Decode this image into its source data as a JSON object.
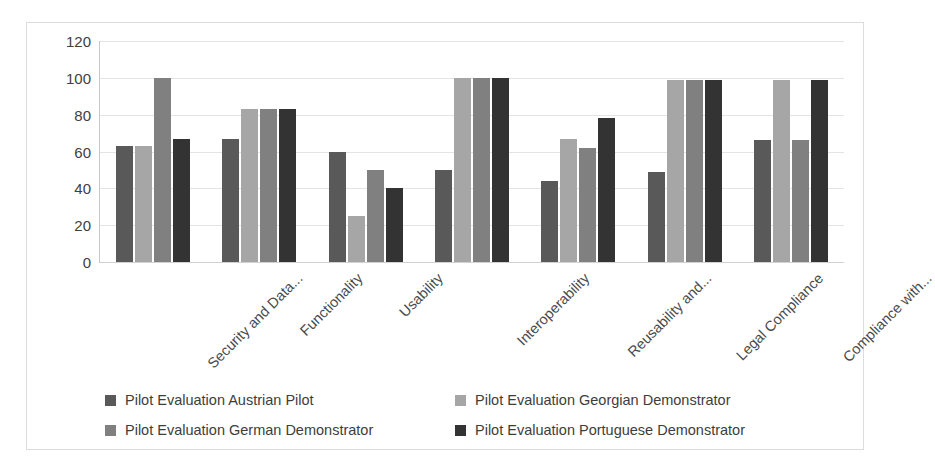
{
  "chart_data": {
    "type": "bar",
    "title": "",
    "xlabel": "",
    "ylabel": "",
    "ylim": [
      0,
      120
    ],
    "y_ticks": [
      0,
      20,
      40,
      60,
      80,
      100,
      120
    ],
    "grid": true,
    "legend_position": "bottom",
    "categories": [
      "Security and Data...",
      "Functionality",
      "Usability",
      "Interoperability",
      "Reusability and...",
      "Legal Compliance",
      "Compliance with..."
    ],
    "series": [
      {
        "name": "Pilot Evaluation Austrian Pilot",
        "color": "#595959",
        "values": [
          63,
          67,
          60,
          50,
          44,
          49,
          66
        ]
      },
      {
        "name": "Pilot Evaluation Georgian Demonstrator",
        "color": "#a6a6a6",
        "values": [
          63,
          83,
          25,
          100,
          67,
          99,
          99
        ]
      },
      {
        "name": "Pilot Evaluation German Demonstrator",
        "color": "#808080",
        "values": [
          100,
          83,
          50,
          100,
          62,
          99,
          66
        ]
      },
      {
        "name": "Pilot Evaluation Portuguese Demonstrator",
        "color": "#333333",
        "values": [
          67,
          83,
          40,
          100,
          78,
          99,
          99
        ]
      }
    ]
  },
  "colors": {
    "background": "#ffffff",
    "border": "#dcdcdc",
    "gridline": "#e4e4e4",
    "axis": "#c8c8c8",
    "tick_text": "#404040",
    "category_text": "#4a4a4a",
    "legend_text": "#3d3d3d"
  }
}
